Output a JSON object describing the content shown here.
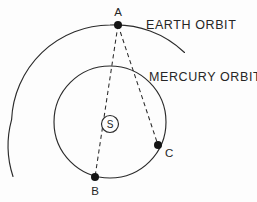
{
  "diagram": {
    "background_color": "#fdfdfd",
    "line_color": "#2b2b2b",
    "dot_color": "#141414",
    "text_color": "#262626",
    "labels": {
      "earth_orbit": "EARTH ORBIT",
      "mercury_orbit": "MERCURY ORBIT",
      "point_a": "A",
      "point_b": "B",
      "point_c": "C",
      "sun": "S"
    },
    "points": [
      {
        "name": "A",
        "label": "A",
        "x": 118,
        "y": 25,
        "on": "earth-orbit",
        "role": "earth-position"
      },
      {
        "name": "B",
        "label": "B",
        "x": 95,
        "y": 177,
        "on": "mercury-orbit",
        "role": "mercury-position"
      },
      {
        "name": "C",
        "label": "C",
        "x": 158,
        "y": 145,
        "on": "mercury-orbit",
        "role": "mercury-position"
      },
      {
        "name": "S",
        "label": "S",
        "x": 110,
        "y": 124,
        "on": "center",
        "role": "sun"
      }
    ],
    "orbits": [
      {
        "name": "earth-orbit",
        "label": "EARTH ORBIT",
        "type": "arc",
        "center_x": 110,
        "center_y": 124,
        "radius": 99,
        "arc_start_deg": 148,
        "arc_end_deg": 318
      },
      {
        "name": "mercury-orbit",
        "label": "MERCURY ORBIT",
        "type": "circle",
        "center_x": 110,
        "center_y": 122,
        "radius": 56
      }
    ],
    "sight_lines": [
      {
        "name": "line-a-b",
        "from": "A",
        "to": "B",
        "style": "dashed"
      },
      {
        "name": "line-a-c",
        "from": "A",
        "to": "C",
        "style": "dashed"
      }
    ],
    "sun_marker": {
      "radius": 8.5,
      "symbol": "S"
    },
    "dot_radius": 4.0,
    "label_positions": {
      "earth_orbit": {
        "x": 146,
        "y": 29
      },
      "mercury_orbit": {
        "x": 149,
        "y": 81
      },
      "point_a": {
        "x": 114,
        "y": 14
      },
      "point_b": {
        "x": 91,
        "y": 196
      },
      "point_c": {
        "x": 166,
        "y": 157
      },
      "sun": {
        "x": 110,
        "y": 128
      }
    }
  }
}
